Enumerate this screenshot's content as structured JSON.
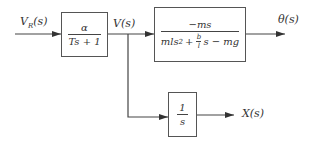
{
  "diagram": {
    "type": "block-diagram",
    "input": {
      "label_main": "V",
      "label_sub": "R",
      "label_tail": "(s)"
    },
    "blocks": [
      {
        "id": "actuator",
        "numerator": "α",
        "denominator": "Ts + 1"
      },
      {
        "id": "pendulum",
        "numerator": "−ms",
        "denominator_parts": {
          "a": "mls",
          "sup": "2",
          "plus": "+",
          "frac_num": "b",
          "frac_den": "l",
          "b": "s − mg"
        }
      },
      {
        "id": "integrator",
        "numerator": "1",
        "denominator": "s"
      }
    ],
    "signals": {
      "v": "V(s)",
      "theta": "θ(s)",
      "x": "X(s)"
    },
    "connections": [
      {
        "from": "input",
        "to": "actuator"
      },
      {
        "from": "actuator",
        "to": "pendulum",
        "label": "V(s)"
      },
      {
        "from": "pendulum",
        "to": "output-theta",
        "label": "θ(s)"
      },
      {
        "from": "branch-V",
        "to": "integrator"
      },
      {
        "from": "integrator",
        "to": "output-x",
        "label": "X(s)"
      }
    ],
    "colors": {
      "line": "#444444",
      "box_border": "#555555",
      "text": "#333333"
    }
  }
}
